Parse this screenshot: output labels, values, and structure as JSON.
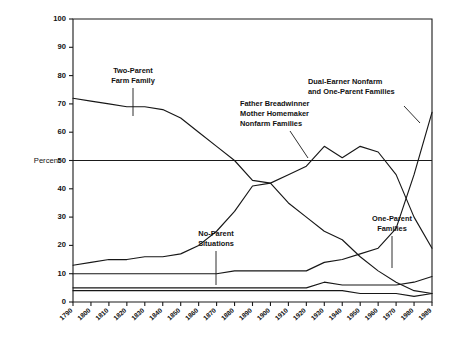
{
  "chart_data": {
    "type": "line",
    "title": "",
    "xlabel": "",
    "ylabel": "Percent",
    "xlim": [
      1790,
      1989
    ],
    "ylim": [
      0,
      100
    ],
    "grid": false,
    "legend": "annotations-inline",
    "xticks": [
      "1790",
      "1800",
      "1810",
      "1820",
      "1830",
      "1840",
      "1850",
      "1860",
      "1870",
      "1880",
      "1890",
      "1900",
      "1910",
      "1920",
      "1930",
      "1940",
      "1950",
      "1960",
      "1970",
      "1980",
      "1989"
    ],
    "yticks": [
      "0",
      "10",
      "20",
      "30",
      "40",
      "50",
      "60",
      "70",
      "80",
      "90",
      "100"
    ],
    "x": [
      1790,
      1800,
      1810,
      1820,
      1830,
      1840,
      1850,
      1860,
      1870,
      1880,
      1890,
      1900,
      1910,
      1920,
      1930,
      1940,
      1950,
      1960,
      1970,
      1980,
      1989
    ],
    "series": [
      {
        "name": "Two-Parent Farm Family",
        "values": [
          72,
          71,
          70,
          69,
          69,
          68,
          65,
          60,
          55,
          50,
          43,
          42,
          35,
          30,
          25,
          22,
          16,
          11,
          7,
          4,
          3
        ]
      },
      {
        "name": "Father Breadwinner Mother Homemaker Nonfarm Families",
        "values": [
          13,
          14,
          15,
          15,
          16,
          16,
          17,
          20,
          25,
          32,
          41,
          42,
          45,
          48,
          55,
          51,
          55,
          53,
          45,
          30,
          19
        ]
      },
      {
        "name": "Dual-Earner Nonfarm and One-Parent Families",
        "values": [
          10,
          10,
          10,
          10,
          10,
          10,
          10,
          10,
          10,
          11,
          11,
          11,
          11,
          11,
          14,
          15,
          17,
          19,
          26,
          45,
          67
        ]
      },
      {
        "name": "One-Parent Families",
        "values": [
          5,
          5,
          5,
          5,
          5,
          5,
          5,
          5,
          5,
          5,
          5,
          5,
          5,
          5,
          7,
          6,
          6,
          6,
          6,
          7,
          9
        ]
      },
      {
        "name": "No-Parent Situations",
        "values": [
          4,
          4,
          4,
          4,
          4,
          4,
          4,
          4,
          4,
          4,
          4,
          4,
          4,
          4,
          4,
          4,
          3,
          3,
          3,
          2,
          3
        ]
      }
    ],
    "annotations": [
      {
        "id": "two-parent-farm",
        "lines": [
          "Two-Parent",
          "Farm  Family"
        ]
      },
      {
        "id": "father-breadwinner",
        "lines": [
          "Father Breadwinner",
          "Mother Homemaker",
          "Nonfarm Families"
        ]
      },
      {
        "id": "dual-earner",
        "lines": [
          "Dual-Earner Nonfarm",
          "and One-Parent Families"
        ]
      },
      {
        "id": "no-parent",
        "lines": [
          "No-Parent",
          "Situations"
        ]
      },
      {
        "id": "one-parent",
        "lines": [
          "One-Parent",
          "Families"
        ]
      }
    ]
  },
  "colors": {
    "line": "#171717",
    "axis": "#1a1a1a",
    "background": "#ffffff"
  }
}
